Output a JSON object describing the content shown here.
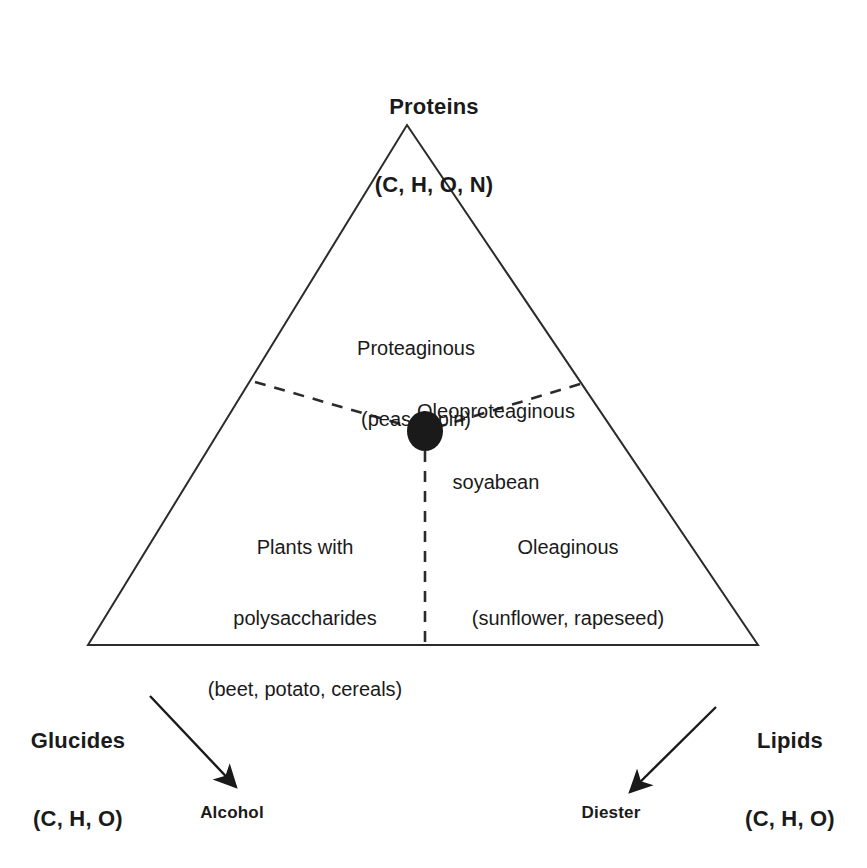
{
  "figure": {
    "kind": "ternary-composition-diagram",
    "background_color": "#ffffff",
    "line_color": "#2b2b2b",
    "dot_color": "#1a1a1a"
  },
  "vertices": {
    "top": {
      "name": "Proteins",
      "line1": "Proteins",
      "line2": "(C, H, O, N)"
    },
    "bottom_left": {
      "name": "Glucides",
      "line1": "Glucides",
      "line2": "(C, H, O)"
    },
    "bottom_right": {
      "name": "Lipids",
      "line1": "Lipids",
      "line2": "(C, H, O)"
    }
  },
  "regions": [
    {
      "id": "proteaginous",
      "line1": "Proteaginous",
      "line2": "(peas, lupin)"
    },
    {
      "id": "oleoproteaginous",
      "line1": "Oleoproteaginous",
      "line2": "soyabean"
    },
    {
      "id": "polysaccharides",
      "line1": "Plants with",
      "line2": "polysaccharides",
      "line3": "(beet, potato, cereals)"
    },
    {
      "id": "oleaginous",
      "line1": "Oleaginous",
      "line2": "(sunflower, rapeseed)"
    }
  ],
  "products": [
    {
      "id": "alcohol",
      "label": "Alcohol",
      "from_vertex": "Glucides"
    },
    {
      "id": "diester",
      "label": "Diester",
      "from_vertex": "Lipids"
    }
  ],
  "marker": {
    "id": "soyabean-point",
    "description": "filled dot at junction of the three region boundaries"
  }
}
